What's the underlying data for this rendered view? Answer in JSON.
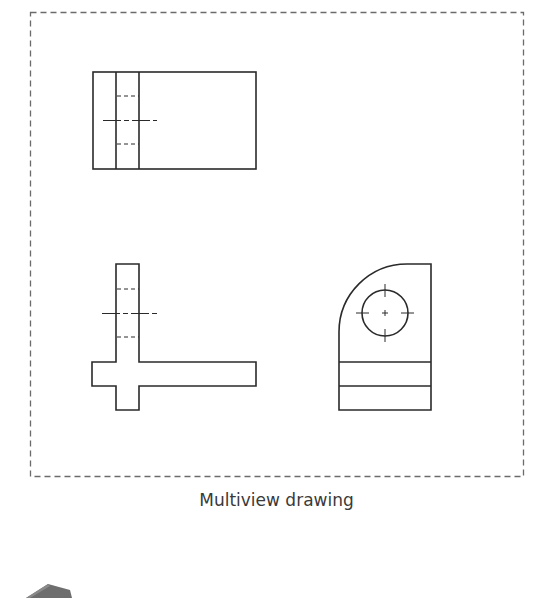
{
  "figure": {
    "caption": "Multiview drawing",
    "frame": {
      "style": "dashed",
      "color": "#6b6b6b"
    },
    "line_color": "#2a2a2a",
    "views": [
      {
        "name": "top-view",
        "description": "Rectangle with vertical slot, hidden-line dashes and centerline"
      },
      {
        "name": "front-view",
        "description": "Inverted T / cross shape with hidden-line hole and centerline"
      },
      {
        "name": "right-side-view",
        "description": "Quarter-round top with circular hole and center marks, two horizontal bands"
      }
    ]
  },
  "partial_object": {
    "name": "isometric-block-thumbnail",
    "color": "#6e6e6e"
  }
}
